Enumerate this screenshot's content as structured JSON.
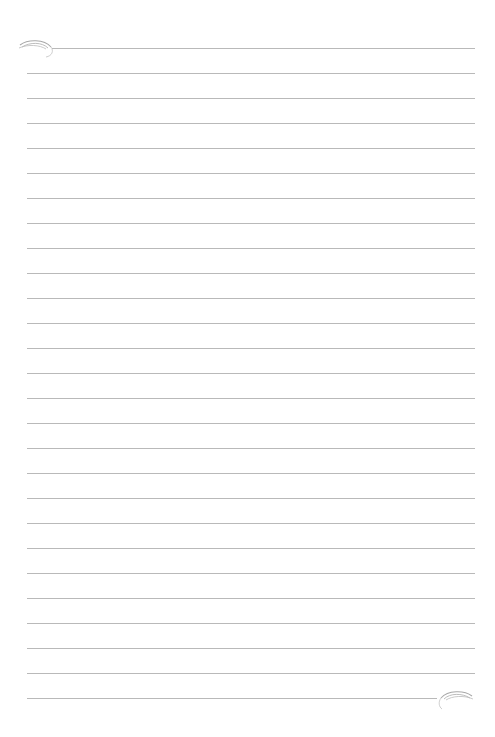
{
  "page": {
    "type": "lined-paper",
    "background_color": "#ffffff",
    "line_color": "#b9b9b9",
    "line_count": 27,
    "line_spacing_px": 25,
    "first_line_y": 48
  },
  "ornaments": {
    "top_left": {
      "icon": "swirl-flourish-icon",
      "color": "#a9a9a9"
    },
    "bottom_right": {
      "icon": "swirl-flourish-icon",
      "color": "#a9a9a9"
    }
  }
}
